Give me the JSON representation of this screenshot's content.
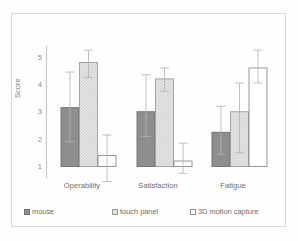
{
  "chart_data": {
    "type": "bar",
    "title": "",
    "xlabel": "",
    "ylabel": "Score",
    "ylim": [
      1,
      5
    ],
    "yticks": [
      1,
      2,
      3,
      4,
      5
    ],
    "grid": false,
    "legend_position": "bottom",
    "categories": [
      "Operability",
      "Satisfaction",
      "Fatigue"
    ],
    "series": [
      {
        "name": "mouse",
        "style": "solid-dark-gray",
        "color": "#8e8e8e",
        "values": [
          3.15,
          3.0,
          2.25
        ],
        "errors_low": [
          1.9,
          2.1,
          1.45
        ],
        "errors_high": [
          4.45,
          4.35,
          3.2
        ]
      },
      {
        "name": "touch panel",
        "style": "checkered-light-gray",
        "color": "#e3e3e3",
        "values": [
          4.8,
          4.2,
          3.0
        ],
        "errors_low": [
          4.25,
          3.75,
          1.5
        ],
        "errors_high": [
          5.25,
          4.6,
          4.05
        ]
      },
      {
        "name": "3D motion capture",
        "style": "white-outline",
        "color": "#ffffff",
        "values": [
          1.4,
          1.2,
          4.6
        ],
        "errors_low": [
          0.45,
          0.75,
          4.05
        ],
        "errors_high": [
          2.15,
          1.85,
          5.25
        ]
      }
    ]
  },
  "axis": {
    "tick_labels": [
      "5",
      "4",
      "3",
      "2",
      "1"
    ],
    "y_axis_title": "Score"
  },
  "legend": {
    "items": [
      {
        "label": "mouse"
      },
      {
        "label": "touch panel"
      },
      {
        "label": "3D motion capture"
      }
    ]
  }
}
